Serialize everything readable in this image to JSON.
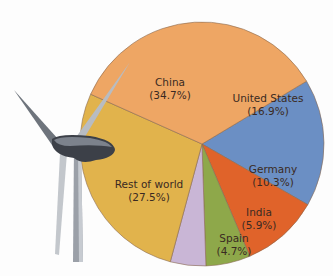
{
  "chart_data": {
    "type": "pie",
    "title": "",
    "center": [
      202,
      144
    ],
    "radius": 122,
    "start_angle_deg": 31,
    "slices": [
      {
        "label": "United States",
        "pct_text": "(16.9%)",
        "value": 16.9,
        "color": "#6b8fc4",
        "lx": 268,
        "ly": 105
      },
      {
        "label": "Germany",
        "pct_text": "(10.3%)",
        "value": 10.3,
        "color": "#e0632a",
        "lx": 273,
        "ly": 176
      },
      {
        "label": "India",
        "pct_text": "(5.9%)",
        "value": 5.9,
        "color": "#8ea84a",
        "lx": 259,
        "ly": 219
      },
      {
        "label": "Spain",
        "pct_text": "(4.7%)",
        "value": 4.7,
        "color": "#c9b6d6",
        "lx": 234,
        "ly": 245
      },
      {
        "label": "Rest of world",
        "pct_text": "(27.5%)",
        "value": 27.5,
        "color": "#e1b34c",
        "lx": 149,
        "ly": 191
      },
      {
        "label": "China",
        "pct_text": "(34.7%)",
        "value": 34.7,
        "color": "#eea664",
        "lx": 170,
        "ly": 89
      }
    ],
    "legend": "none",
    "decoration": "wind-turbine illustration at left"
  }
}
